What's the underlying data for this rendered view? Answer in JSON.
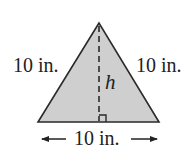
{
  "figure": {
    "shape": "equilateral-triangle",
    "fill_color": "#cfcfcf",
    "stroke_color": "#2a2a2a",
    "labels": {
      "left_side": "10 in.",
      "right_side": "10 in.",
      "base": "10 in.",
      "height": "h"
    },
    "icons": {
      "base_left_arrow": "left-arrow",
      "base_right_arrow": "right-arrow",
      "right_angle_marker": "right-angle-square"
    }
  }
}
